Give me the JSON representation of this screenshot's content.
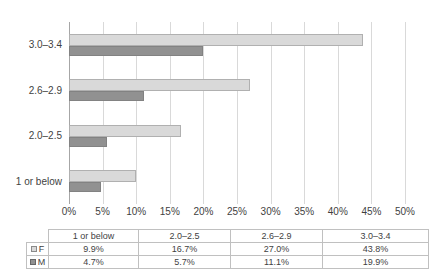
{
  "chart_data": {
    "type": "bar",
    "orientation": "horizontal",
    "title": "",
    "xlabel": "",
    "ylabel": "",
    "categories": [
      "1 or below",
      "2.0–2.5",
      "2.6–2.9",
      "3.0–3.4"
    ],
    "category_display_order_top_to_bottom": [
      "3.0–3.4",
      "2.6–2.9",
      "2.0–2.5",
      "1 or below"
    ],
    "series": [
      {
        "name": "F",
        "values": [
          9.9,
          16.7,
          27.0,
          43.8
        ],
        "color": "#d9d9d9"
      },
      {
        "name": "M",
        "values": [
          4.7,
          5.7,
          11.1,
          19.9
        ],
        "color": "#919191"
      }
    ],
    "xlim": [
      0,
      50
    ],
    "x_tick_step": 5,
    "x_ticks": [
      "0%",
      "5%",
      "10%",
      "15%",
      "20%",
      "25%",
      "30%",
      "35%",
      "40%",
      "45%",
      "50%"
    ],
    "grid": "vertical",
    "legend_position": "data-table-left"
  },
  "table": {
    "corner": "",
    "headers": [
      "1 or below",
      "2.0–2.5",
      "2.6–2.9",
      "3.0–3.4"
    ],
    "rows": [
      {
        "legend": "F",
        "cells": [
          "9.9%",
          "16.7%",
          "27.0%",
          "43.8%"
        ]
      },
      {
        "legend": "M",
        "cells": [
          "4.7%",
          "5.7%",
          "11.1%",
          "19.9%"
        ]
      }
    ]
  },
  "colors": {
    "f_fill": "#d9d9d9",
    "f_border": "#b0b0b0",
    "m_fill": "#919191",
    "m_border": "#828282",
    "gridline": "#d9d9d9",
    "axis_line": "#a6a6a6",
    "text": "#3f3f3f",
    "table_border": "#c0c0c0",
    "background": "#ffffff"
  }
}
